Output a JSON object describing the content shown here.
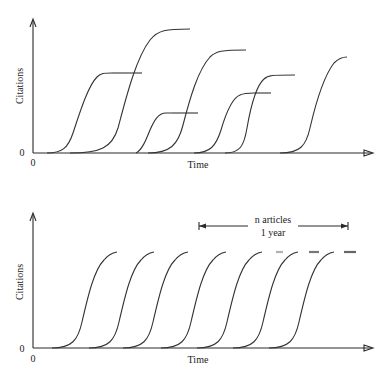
{
  "top_panel": {
    "y_axis_label": "Citations",
    "x_axis_label": "Time",
    "y_origin_label": "0",
    "x_origin_label": "0"
  },
  "bottom_panel": {
    "y_axis_label": "Citations",
    "x_axis_label": "Time",
    "y_origin_label": "0",
    "x_origin_label": "0",
    "annotation_line1": "n articles",
    "annotation_line2": "1 year"
  },
  "colors": {
    "line": "#333333",
    "background": "#ffffff"
  }
}
